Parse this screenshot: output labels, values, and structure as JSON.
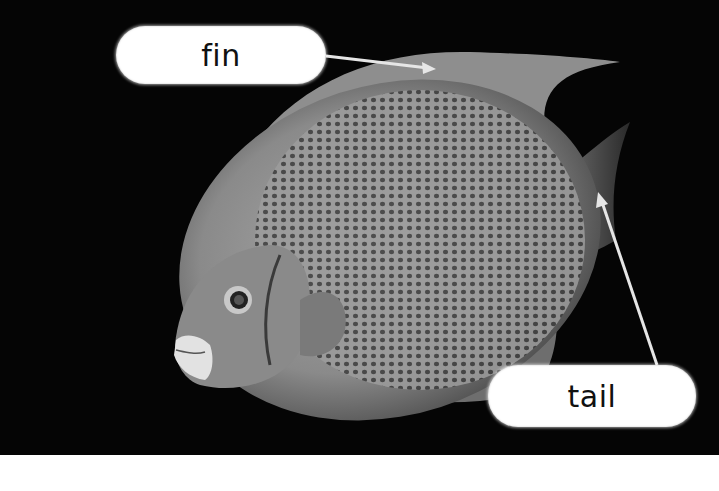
{
  "image": {
    "subject": "angelfish photograph",
    "background_color": "#050505",
    "fish_tone": "#9a9a9a",
    "label_background": "#ffffff",
    "label_text_color": "#111111",
    "arrow_color": "#e6e6e6"
  },
  "labels": [
    {
      "id": "fin",
      "text": "fin",
      "arrow_from": [
        326,
        56
      ],
      "arrow_to": [
        432,
        68
      ]
    },
    {
      "id": "tail",
      "text": "tail",
      "arrow_from": [
        657,
        365
      ],
      "arrow_to": [
        598,
        194
      ]
    }
  ]
}
